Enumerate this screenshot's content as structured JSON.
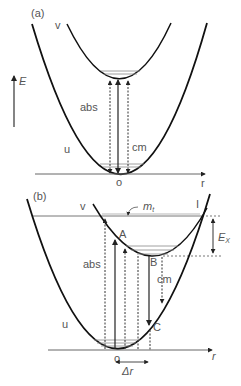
{
  "figure": {
    "colors": {
      "curve": "#111111",
      "line": "#666666",
      "text": "#555555",
      "level": "#888888"
    },
    "panel_a": {
      "label": "(a)",
      "upper_curve_label": "v",
      "lower_curve_label": "u",
      "energy_axis_label": "E",
      "absorption_label": "abs",
      "emission_label": "cm",
      "origin_label": "o",
      "r_axis_label": "r"
    },
    "panel_b": {
      "label": "(b)",
      "upper_curve_label": "v",
      "lower_curve_label": "u",
      "absorption_label": "abs",
      "emission_label": "cm",
      "origin_label": "o",
      "r_axis_label": "r",
      "crossing_label": "I",
      "level_label_main": "m",
      "level_label_sub": "t",
      "energy_gap_main": "E",
      "energy_gap_sub": "X",
      "point_a": "A",
      "point_b": "B",
      "point_c": "C",
      "displacement_label": "Δr"
    }
  }
}
